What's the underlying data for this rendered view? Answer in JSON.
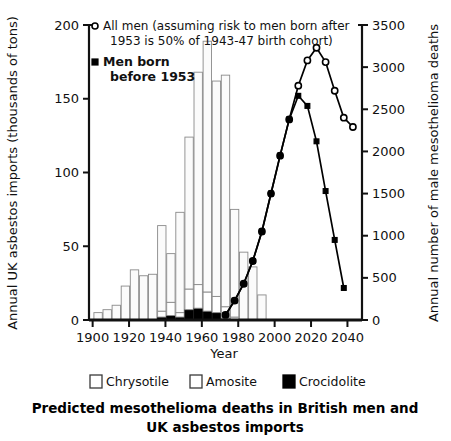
{
  "chart_data": {
    "type": "bar",
    "title_line1": "Predicted mesothelioma deaths in British men and",
    "title_line2": "UK asbestos imports",
    "xlabel": "Year",
    "ylabel_left": "Annual UK asbestos imports (thousands of tons)",
    "ylabel_right": "Annual number of male mesothelioma deaths",
    "xlim": [
      1898,
      2048
    ],
    "xticks": [
      1900,
      1920,
      1940,
      1960,
      1980,
      2000,
      2020,
      2040
    ],
    "xticklabels": [
      "1900",
      "1920",
      "1940",
      "1960",
      "1980",
      "2000",
      "2020",
      "2040"
    ],
    "ylim_left": [
      0,
      200
    ],
    "yticks_left": [
      0,
      50,
      100,
      150,
      200
    ],
    "yticklabels_left": [
      "0",
      "50",
      "100",
      "150",
      "200"
    ],
    "ylim_right": [
      0,
      3500
    ],
    "yticks_right": [
      0,
      500,
      1000,
      1500,
      2000,
      2500,
      3000,
      3500
    ],
    "yticklabels_right": [
      "0",
      "500",
      "1000",
      "1500",
      "2000",
      "2500",
      "3000",
      "3500"
    ],
    "grid": false,
    "bar_legend_position": "below-axis",
    "line_legend_position": "upper-left-inside",
    "stacked_bars": {
      "note": "Stacked asbestos imports by fibre type, 5-year bins, left axis (thousands of tons)",
      "categories": [
        1903,
        1908,
        1913,
        1918,
        1923,
        1928,
        1933,
        1938,
        1943,
        1948,
        1953,
        1958,
        1963,
        1968,
        1973,
        1978,
        1983,
        1988,
        1993
      ],
      "series": [
        {
          "name": "Chrysotile",
          "color": "#fbfbfb",
          "values": [
            5,
            7,
            10,
            23,
            34,
            30,
            31,
            58,
            33,
            68,
            103,
            144,
            170,
            146,
            157,
            73,
            46,
            36,
            17
          ]
        },
        {
          "name": "Amosite",
          "color": "#ffffff",
          "values": [
            0,
            0,
            0,
            0,
            0,
            0,
            0,
            4,
            9,
            3,
            14,
            16,
            13,
            11,
            8,
            2,
            0,
            0,
            0
          ]
        },
        {
          "name": "Crocidolite",
          "color": "#000000",
          "values": [
            0,
            0,
            0,
            0,
            0,
            0,
            0,
            2,
            3,
            2,
            7,
            8,
            6,
            5,
            1,
            0,
            0,
            0,
            0
          ]
        }
      ]
    },
    "lines": [
      {
        "name": "All men (assuming risk to men born after 1953 is 50% of 1943-47 birth cohort)",
        "marker": "open-circle",
        "axis": "right",
        "x": [
          1973,
          1978,
          1983,
          1988,
          1993,
          1998,
          2003,
          2008,
          2013,
          2018,
          2023,
          2028,
          2033,
          2038,
          2043
        ],
        "y": [
          60,
          230,
          430,
          700,
          1050,
          1500,
          1950,
          2380,
          2780,
          3080,
          3230,
          3060,
          2720,
          2400,
          2290
        ]
      },
      {
        "name": "Men born before 1953",
        "marker": "filled-square",
        "axis": "right",
        "x": [
          1973,
          1978,
          1983,
          1988,
          1993,
          1998,
          2003,
          2008,
          2013,
          2018,
          2023,
          2028,
          2033,
          2038
        ],
        "y": [
          60,
          230,
          430,
          700,
          1050,
          1500,
          1950,
          2380,
          2660,
          2540,
          2120,
          1530,
          950,
          380
        ]
      }
    ]
  },
  "legend_lines": {
    "item1_line1": "All men (assuming risk to men born after",
    "item1_line2": "1953 is 50% of 1943-47 birth cohort)",
    "item2_line1": "Men born",
    "item2_line2": "before 1953"
  },
  "legend_bars": {
    "chrysotile": "Chrysotile",
    "amosite": "Amosite",
    "crocidolite": "Crocidolite"
  },
  "colors": {
    "axis": "#111111",
    "bar_outline": "#8a8a8a",
    "crocidolite": "#000000",
    "background": "#ffffff"
  }
}
